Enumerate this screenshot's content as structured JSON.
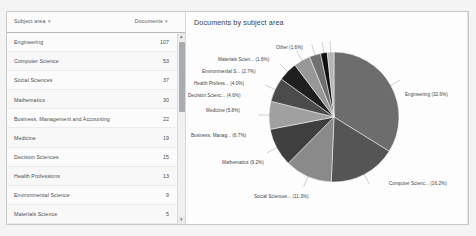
{
  "panel": {
    "table": {
      "columns": [
        {
          "label": "Subject area",
          "sort_icon": "sort-descending-icon"
        },
        {
          "label": "Documents",
          "sort_icon": "sort-descending-icon"
        }
      ],
      "rows": [
        {
          "subject": "Engineering",
          "documents": "107"
        },
        {
          "subject": "Computer Science",
          "documents": "53"
        },
        {
          "subject": "Social Sciences",
          "documents": "37"
        },
        {
          "subject": "Mathematics",
          "documents": "30"
        },
        {
          "subject": "Business, Management and Accounting",
          "documents": "22"
        },
        {
          "subject": "Medicine",
          "documents": "19"
        },
        {
          "subject": "Decision Sciences",
          "documents": "15"
        },
        {
          "subject": "Health Professions",
          "documents": "13"
        },
        {
          "subject": "Environmental Science",
          "documents": "9"
        },
        {
          "subject": "Materials Science",
          "documents": "5"
        }
      ],
      "scrollbar": {
        "up": "▴",
        "down": "▾"
      }
    },
    "chart": {
      "title": "Documents by subject area"
    }
  },
  "chart_data": {
    "type": "pie",
    "title": "Documents by subject area",
    "xlabel": "",
    "ylabel": "",
    "grid": false,
    "legend_position": "callout-labels",
    "labels": [
      "Engineering",
      "Computer Scienc...",
      "Social Sciences...",
      "Mathematics",
      "Business, Manag...",
      "Medicine",
      "Decision Scienc...",
      "Health Profess...",
      "Environmental S...",
      "Materials Scien...",
      "Other"
    ],
    "percentages": [
      32.6,
      16.2,
      11.3,
      9.2,
      6.7,
      5.8,
      4.6,
      4.0,
      2.7,
      1.6,
      1.6
    ],
    "values": [
      107,
      53,
      37,
      30,
      22,
      19,
      15,
      13,
      9,
      5,
      5
    ],
    "annotations": [
      "Engineering (32.6%)",
      "Computer Scienc... (16.2%)",
      "Social Sciences... (11.3%)",
      "Mathematics (9.2%)",
      "Business, Manag... (6.7%)",
      "Medicine (5.8%)",
      "Decision Scienc... (4.6%)",
      "Health Profess... (4.0%)",
      "Environmental S... (2.7%)",
      "Materials Scien... (1.6%)",
      "Other (1.6%)"
    ],
    "colors": [
      "#6d6d6d",
      "#555555",
      "#8a8a8a",
      "#3f3f3f",
      "#a0a0a0",
      "#4b4b4b",
      "#1f1f1f",
      "#989898",
      "#707070",
      "#111111",
      "#b5b5b5"
    ]
  }
}
